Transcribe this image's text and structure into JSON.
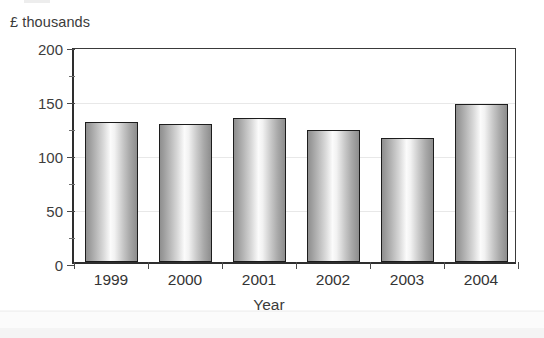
{
  "chart_data": {
    "type": "bar",
    "title": "",
    "subtitle": "",
    "xlabel": "Year",
    "ylabel": "£ thousands",
    "categories": [
      "1999",
      "2000",
      "2001",
      "2002",
      "2003",
      "2004"
    ],
    "values": [
      130,
      128,
      133,
      122,
      115,
      146
    ],
    "ylim": [
      0,
      200
    ],
    "ytick_labels": [
      "0",
      "50",
      "100",
      "150",
      "200"
    ],
    "ytick_values": [
      0,
      50,
      100,
      150,
      200
    ],
    "yminor_values": [
      25,
      75,
      125,
      175
    ],
    "grid": true,
    "legend": false,
    "legend_position": "none",
    "bar_style": "cylinder-gradient-greyscale",
    "colors": {
      "bar_edge": "#1c1c1c",
      "bar_light": "#fbfbfb",
      "bar_dark": "#8f8f8f",
      "axis": "#2e2e2e",
      "gridline": "#e8e8e8",
      "text": "#3b3b3b",
      "background": "#ffffff"
    }
  }
}
